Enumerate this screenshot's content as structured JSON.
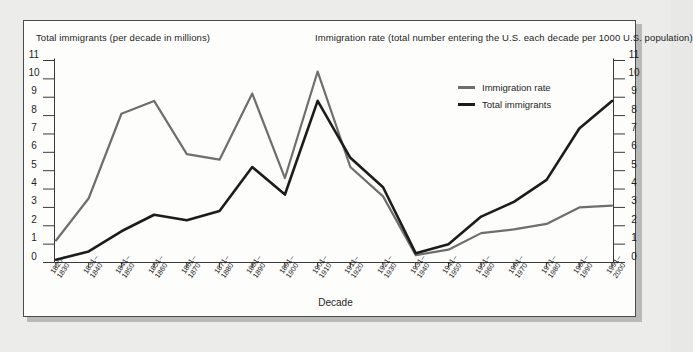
{
  "chart_data": {
    "type": "line",
    "title": "",
    "xlabel": "Decade",
    "ylabel_left": "Total immigrants (per decade in millions)",
    "ylabel_right": "Immigration rate (total number entering the U.S. each decade per 1000 U.S. population)",
    "ylim": [
      0,
      11
    ],
    "yticks": [
      0,
      1,
      2,
      3,
      4,
      5,
      6,
      7,
      8,
      9,
      10,
      11
    ],
    "grid": false,
    "legend_position": "upper-right-inside",
    "categories": [
      "1820–\n1830",
      "1831–\n1840",
      "1841–\n1850",
      "1851–\n1860",
      "1861–\n1870",
      "1871–\n1880",
      "1881–\n1890",
      "1891–\n1900",
      "1901–\n1910",
      "1911–\n1920",
      "1921–\n1930",
      "1931–\n1940",
      "1941–\n1950",
      "1951–\n1960",
      "1961–\n1970",
      "1971–\n1980",
      "1981–\n1990",
      "1991–\n2000"
    ],
    "categories_top": [
      "1820–",
      "1831–",
      "1841–",
      "1851–",
      "1861–",
      "1871–",
      "1881–",
      "1891–",
      "1901–",
      "1911–",
      "1921–",
      "1931–",
      "1941–",
      "1951–",
      "1961–",
      "1971–",
      "1981–",
      "1991–"
    ],
    "categories_bottom": [
      "1830",
      "1840",
      "1850",
      "1860",
      "1870",
      "1880",
      "1890",
      "1900",
      "1910",
      "1920",
      "1930",
      "1940",
      "1950",
      "1960",
      "1970",
      "1980",
      "1990",
      "2000"
    ],
    "series": [
      {
        "name": "Immigration rate",
        "color": "#6e6e6e",
        "values": [
          1.2,
          3.5,
          8.1,
          8.8,
          5.9,
          5.6,
          9.2,
          4.6,
          10.4,
          5.2,
          3.6,
          0.4,
          0.7,
          1.6,
          1.8,
          2.1,
          3.0,
          3.1
        ]
      },
      {
        "name": "Total immigrants",
        "color": "#1c1c1c",
        "values": [
          0.15,
          0.6,
          1.7,
          2.6,
          2.3,
          2.8,
          5.2,
          3.7,
          8.8,
          5.7,
          4.1,
          0.5,
          1.0,
          2.5,
          3.3,
          4.5,
          7.3,
          8.8
        ]
      }
    ]
  },
  "legend": {
    "items": [
      {
        "label": "Immigration rate",
        "color": "#6e6e6e"
      },
      {
        "label": "Total immigrants",
        "color": "#1c1c1c"
      }
    ]
  }
}
